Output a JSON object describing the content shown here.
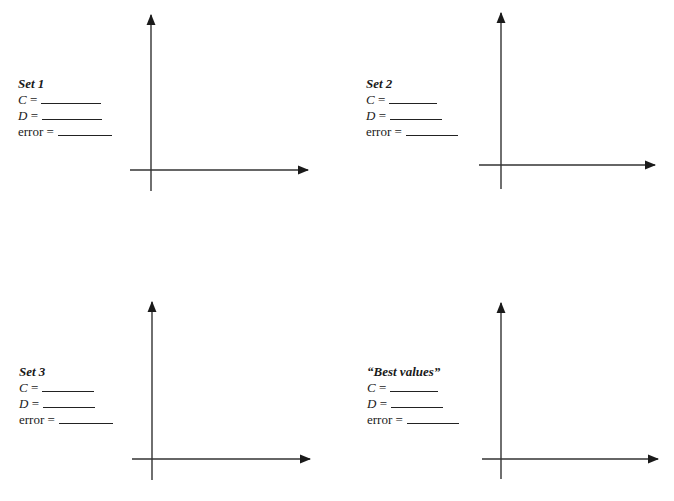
{
  "worksheet": {
    "panels": [
      {
        "title": "Set 1",
        "fields": [
          {
            "var": "C",
            "eq": " =",
            "value": "",
            "blank_width": 60
          },
          {
            "var": "D",
            "eq": " =",
            "value": "",
            "blank_width": 60
          },
          {
            "var": "error",
            "eq": " =",
            "value": "",
            "blank_width": 54
          }
        ],
        "label_pos": {
          "x": 18,
          "y": 76
        },
        "axes": {
          "origin_x": 151,
          "origin_y": 170,
          "y_top": 15,
          "y_bottom": 191,
          "x_left": 130,
          "x_right": 308
        }
      },
      {
        "title": "Set 2",
        "fields": [
          {
            "var": "C",
            "eq": " =",
            "value": "",
            "blank_width": 48
          },
          {
            "var": "D",
            "eq": " =",
            "value": "",
            "blank_width": 52
          },
          {
            "var": "error",
            "eq": " =",
            "value": "",
            "blank_width": 52
          }
        ],
        "label_pos": {
          "x": 366,
          "y": 76
        },
        "axes": {
          "origin_x": 501,
          "origin_y": 165,
          "y_top": 13,
          "y_bottom": 189,
          "x_left": 479,
          "x_right": 655
        }
      },
      {
        "title": "Set 3",
        "fields": [
          {
            "var": "C",
            "eq": " =",
            "value": "",
            "blank_width": 52
          },
          {
            "var": "D",
            "eq": " =",
            "value": "",
            "blank_width": 52
          },
          {
            "var": "error",
            "eq": " =",
            "value": "",
            "blank_width": 54
          }
        ],
        "label_pos": {
          "x": 19,
          "y": 364
        },
        "axes": {
          "origin_x": 152,
          "origin_y": 459,
          "y_top": 302,
          "y_bottom": 480,
          "x_left": 132,
          "x_right": 310
        }
      },
      {
        "title": "“Best values”",
        "fields": [
          {
            "var": "C",
            "eq": " =",
            "value": "",
            "blank_width": 48
          },
          {
            "var": "D",
            "eq": " =",
            "value": "",
            "blank_width": 52
          },
          {
            "var": "error",
            "eq": " =",
            "value": "",
            "blank_width": 52
          }
        ],
        "label_pos": {
          "x": 367,
          "y": 364
        },
        "axes": {
          "origin_x": 501,
          "origin_y": 459,
          "y_top": 303,
          "y_bottom": 479,
          "x_left": 482,
          "x_right": 658
        }
      }
    ],
    "colors": {
      "ink": "#1a1a1a",
      "background": "#ffffff"
    }
  }
}
